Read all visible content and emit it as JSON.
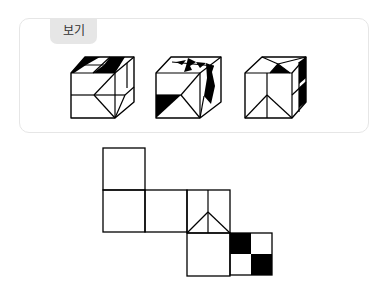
{
  "example_box": {
    "label": "보기"
  },
  "colors": {
    "stroke": "#000000",
    "fill_black": "#000000",
    "fill_white": "#ffffff",
    "card_border": "#e6e6e6",
    "label_bg": "#e6e6e6"
  },
  "cubes": [
    {
      "name": "cube-1",
      "outline": [
        [
          71,
          73
        ],
        [
          85,
          57
        ],
        [
          134,
          57
        ],
        [
          134,
          102
        ],
        [
          115,
          118
        ],
        [
          71,
          118
        ]
      ],
      "black": [
        [
          [
            85,
            57
          ],
          [
            100,
            57
          ],
          [
            86,
            65
          ],
          [
            78,
            65
          ]
        ],
        [
          [
            110,
            57
          ],
          [
            125,
            57
          ],
          [
            120,
            65
          ],
          [
            104,
            65
          ]
        ],
        [
          [
            104,
            65
          ],
          [
            120,
            65
          ],
          [
            115,
            73
          ],
          [
            93,
            73
          ]
        ],
        [
          [
            86,
            65
          ],
          [
            78,
            65
          ],
          [
            71,
            73
          ],
          [
            74,
            73
          ]
        ]
      ],
      "lines": [
        [
          [
            71,
            73
          ],
          [
            115,
            73
          ]
        ],
        [
          [
            115,
            73
          ],
          [
            134,
            57
          ]
        ],
        [
          [
            115,
            73
          ],
          [
            115,
            118
          ]
        ],
        [
          [
            71,
            95
          ],
          [
            94,
            95
          ]
        ],
        [
          [
            115,
            73
          ],
          [
            94,
            95
          ]
        ],
        [
          [
            94,
            95
          ],
          [
            115,
            118
          ]
        ],
        [
          [
            94,
            95
          ],
          [
            125,
            95
          ]
        ],
        [
          [
            125,
            95
          ],
          [
            134,
            87
          ]
        ],
        [
          [
            125,
            95
          ],
          [
            115,
            118
          ]
        ],
        [
          [
            127,
            63
          ],
          [
            127,
            88
          ]
        ],
        [
          [
            93,
            73
          ],
          [
            110,
            57
          ]
        ],
        [
          [
            78,
            65
          ],
          [
            120,
            65
          ]
        ]
      ]
    },
    {
      "name": "cube-2",
      "outline": [
        [
          156,
          73
        ],
        [
          171,
          57
        ],
        [
          221,
          57
        ],
        [
          221,
          102
        ],
        [
          200,
          118
        ],
        [
          156,
          118
        ]
      ],
      "black": [
        [
          [
            156,
            95
          ],
          [
            181,
            95
          ],
          [
            156,
            118
          ]
        ],
        [
          [
            176,
            62
          ],
          [
            186,
            60
          ],
          [
            182,
            65
          ]
        ],
        [
          [
            188,
            58
          ],
          [
            196,
            62
          ],
          [
            190,
            66
          ],
          [
            192,
            70
          ],
          [
            184,
            72
          ],
          [
            186,
            66
          ]
        ],
        [
          [
            196,
            62
          ],
          [
            206,
            63
          ],
          [
            200,
            68
          ]
        ],
        [
          [
            206,
            63
          ],
          [
            214,
            66
          ],
          [
            212,
            72
          ],
          [
            215,
            86
          ],
          [
            211,
            104
          ],
          [
            204,
            96
          ],
          [
            207,
            78
          ]
        ]
      ],
      "lines": [
        [
          [
            156,
            73
          ],
          [
            200,
            73
          ]
        ],
        [
          [
            200,
            73
          ],
          [
            221,
            57
          ]
        ],
        [
          [
            200,
            73
          ],
          [
            200,
            118
          ]
        ],
        [
          [
            156,
            95
          ],
          [
            181,
            95
          ]
        ],
        [
          [
            200,
            73
          ],
          [
            181,
            95
          ]
        ],
        [
          [
            181,
            95
          ],
          [
            200,
            118
          ]
        ],
        [
          [
            172,
            62
          ],
          [
            214,
            66
          ]
        ],
        [
          [
            204,
            96
          ],
          [
            200,
            118
          ]
        ]
      ]
    },
    {
      "name": "cube-3",
      "outline": [
        [
          245,
          73
        ],
        [
          262,
          57
        ],
        [
          306,
          57
        ],
        [
          306,
          102
        ],
        [
          292,
          118
        ],
        [
          245,
          118
        ]
      ],
      "black": [
        [
          [
            270,
            73
          ],
          [
            278,
            64
          ],
          [
            290,
            73
          ]
        ],
        [
          [
            299,
            62
          ],
          [
            306,
            57
          ],
          [
            306,
            78
          ],
          [
            299,
            84
          ]
        ],
        [
          [
            299,
            88
          ],
          [
            306,
            82
          ],
          [
            306,
            102
          ],
          [
            299,
            108
          ]
        ]
      ],
      "lines": [
        [
          [
            245,
            73
          ],
          [
            292,
            73
          ]
        ],
        [
          [
            292,
            73
          ],
          [
            306,
            57
          ]
        ],
        [
          [
            292,
            73
          ],
          [
            292,
            118
          ]
        ],
        [
          [
            262,
            57
          ],
          [
            278,
            64
          ]
        ],
        [
          [
            306,
            57
          ],
          [
            278,
            64
          ]
        ],
        [
          [
            278,
            64
          ],
          [
            270,
            73
          ]
        ],
        [
          [
            278,
            64
          ],
          [
            290,
            73
          ]
        ],
        [
          [
            267,
            73
          ],
          [
            267,
            118
          ]
        ],
        [
          [
            267,
            95
          ],
          [
            245,
            118
          ]
        ],
        [
          [
            267,
            95
          ],
          [
            292,
            118
          ]
        ],
        [
          [
            299,
            62
          ],
          [
            299,
            112
          ]
        ],
        [
          [
            292,
            95
          ],
          [
            306,
            82
          ]
        ]
      ]
    }
  ],
  "net": {
    "squares": [
      {
        "name": "net-face-1",
        "x": 103,
        "y": 148,
        "size": 42
      },
      {
        "name": "net-face-2",
        "x": 103,
        "y": 190,
        "size": 42
      },
      {
        "name": "net-face-3",
        "x": 145,
        "y": 190,
        "size": 42
      },
      {
        "name": "net-face-4",
        "x": 187,
        "y": 190,
        "size": 43
      },
      {
        "name": "net-face-5",
        "x": 187,
        "y": 233,
        "size": 43
      },
      {
        "name": "net-face-6",
        "x": 230,
        "y": 233,
        "size": 42
      }
    ],
    "lines": [
      [
        [
          208,
          190
        ],
        [
          208,
          233
        ]
      ],
      [
        [
          208,
          212
        ],
        [
          187,
          233
        ]
      ],
      [
        [
          208,
          212
        ],
        [
          230,
          233
        ]
      ]
    ],
    "black": [
      [
        [
          230,
          233
        ],
        [
          251,
          233
        ],
        [
          251,
          254
        ],
        [
          230,
          254
        ]
      ],
      [
        [
          251,
          254
        ],
        [
          272,
          254
        ],
        [
          272,
          275
        ],
        [
          251,
          275
        ]
      ]
    ]
  }
}
